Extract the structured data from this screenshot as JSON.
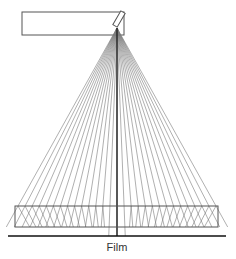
{
  "labels": {
    "film": "Film"
  },
  "geometry": {
    "width": 236,
    "height": 259,
    "tube": {
      "x": 22,
      "y": 12,
      "w": 102,
      "h": 23
    },
    "focal_point": {
      "x": 117,
      "y": 28
    },
    "ray_count": 29,
    "slab": {
      "x": 15,
      "y": 206,
      "w": 203,
      "h": 21
    },
    "ray_spread": {
      "left": 18,
      "right": 216
    },
    "film_line": {
      "y": 236,
      "x1": 8,
      "x2": 226
    },
    "film_label": {
      "x": 117,
      "y": 241
    }
  },
  "colors": {
    "stroke": "#555555",
    "ray": "#7a7a7a",
    "central": "#222222",
    "film": "#111111",
    "background": "#ffffff"
  }
}
